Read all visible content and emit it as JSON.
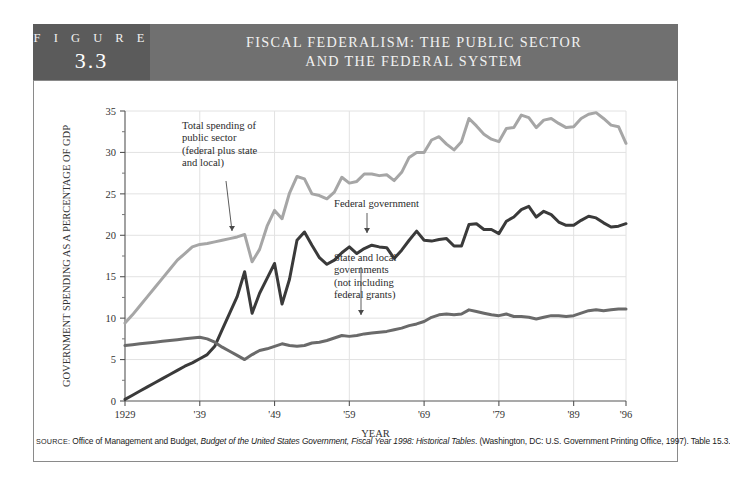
{
  "header": {
    "figure_word": "F I G U R E",
    "figure_number": "3.3",
    "title_line1": "FISCAL FEDERALISM: THE PUBLIC SECTOR",
    "title_line2": "AND THE FEDERAL SYSTEM",
    "box_color": "#5b5b5b",
    "title_bg_color": "#707070"
  },
  "source": {
    "label": "SOURCE:",
    "text_before_italic": " Office of Management and Budget, ",
    "italic_text": "Budget of the United States Government, Fiscal Year 1998: Historical Tables",
    "text_after_italic": ". (Washington, DC: U.S. Government Printing Office, 1997). Table 15.3."
  },
  "annotations": [
    {
      "id": "total-spending",
      "lines": [
        "Total spending of",
        "public sector",
        "(federal plus state",
        "and local)"
      ]
    },
    {
      "id": "federal-government",
      "lines": [
        "Federal government"
      ]
    },
    {
      "id": "state-local",
      "lines": [
        "State and local",
        "governments",
        "(not including",
        "federal grants)"
      ]
    }
  ],
  "chart_data": {
    "type": "line",
    "title": "FISCAL FEDERALISM: THE PUBLIC SECTOR AND THE FEDERAL SYSTEM",
    "xlabel": "YEAR",
    "ylabel": "GOVERNMENT SPENDING AS A PERCENTAGE OF GDP",
    "xlim": [
      1929,
      1996
    ],
    "ylim": [
      0,
      35
    ],
    "yticks": [
      0,
      5,
      10,
      15,
      20,
      25,
      30,
      35
    ],
    "xticks": [
      1929,
      1939,
      1949,
      1959,
      1969,
      1979,
      1989,
      1996
    ],
    "xticklabels": [
      "1929",
      "'39",
      "'49",
      "'59",
      "'69",
      "'79",
      "'89",
      "'96"
    ],
    "grid": true,
    "legend": "annotations",
    "x": [
      1929,
      1930,
      1931,
      1932,
      1933,
      1934,
      1935,
      1936,
      1937,
      1938,
      1939,
      1940,
      1941,
      1942,
      1943,
      1944,
      1945,
      1946,
      1947,
      1948,
      1949,
      1950,
      1951,
      1952,
      1953,
      1954,
      1955,
      1956,
      1957,
      1958,
      1959,
      1960,
      1961,
      1962,
      1963,
      1964,
      1965,
      1966,
      1967,
      1968,
      1969,
      1970,
      1971,
      1972,
      1973,
      1974,
      1975,
      1976,
      1977,
      1978,
      1979,
      1980,
      1981,
      1982,
      1983,
      1984,
      1985,
      1986,
      1987,
      1988,
      1989,
      1990,
      1991,
      1992,
      1993,
      1994,
      1995,
      1996
    ],
    "series": [
      {
        "name": "Total spending of public sector (federal plus state and local)",
        "color": "#a6a6a6",
        "values": [
          9.4,
          10.4,
          11.5,
          12.6,
          13.7,
          14.8,
          15.9,
          17.0,
          17.8,
          18.6,
          18.9,
          19.0,
          19.2,
          19.4,
          19.6,
          19.8,
          20.1,
          16.8,
          18.3,
          21.1,
          23.0,
          22.0,
          25.1,
          27.1,
          26.8,
          25.0,
          24.8,
          24.4,
          25.2,
          27.0,
          26.3,
          26.5,
          27.4,
          27.4,
          27.2,
          27.3,
          26.6,
          27.6,
          29.4,
          30.0,
          30.0,
          31.5,
          31.9,
          31.0,
          30.3,
          31.3,
          34.1,
          33.2,
          32.2,
          31.6,
          31.3,
          32.9,
          33.0,
          34.5,
          34.2,
          33.0,
          33.9,
          34.1,
          33.5,
          33.0,
          33.1,
          34.1,
          34.6,
          34.8,
          34.1,
          33.3,
          33.1,
          31.1
        ]
      },
      {
        "name": "Federal government",
        "color": "#3a3a3a",
        "values": [
          0.2,
          0.7,
          1.2,
          1.7,
          2.2,
          2.7,
          3.2,
          3.7,
          4.2,
          4.6,
          5.1,
          5.6,
          6.6,
          8.6,
          10.6,
          12.6,
          15.6,
          10.6,
          13.0,
          14.8,
          16.6,
          11.7,
          14.7,
          19.4,
          20.4,
          18.8,
          17.3,
          16.5,
          17.0,
          17.9,
          18.6,
          17.8,
          18.4,
          18.8,
          18.6,
          18.5,
          17.2,
          18.2,
          19.4,
          20.5,
          19.4,
          19.3,
          19.5,
          19.6,
          18.7,
          18.7,
          21.3,
          21.4,
          20.7,
          20.7,
          20.2,
          21.7,
          22.2,
          23.1,
          23.5,
          22.2,
          22.9,
          22.5,
          21.6,
          21.2,
          21.2,
          21.8,
          22.3,
          22.1,
          21.5,
          21.0,
          21.1,
          21.4
        ]
      },
      {
        "name": "State and local governments (not including federal grants)",
        "color": "#6a6a6a",
        "values": [
          6.7,
          6.8,
          6.9,
          7.0,
          7.1,
          7.2,
          7.3,
          7.4,
          7.5,
          7.6,
          7.7,
          7.5,
          7.1,
          6.5,
          6.0,
          5.5,
          5.0,
          5.6,
          6.1,
          6.3,
          6.6,
          6.9,
          6.7,
          6.6,
          6.7,
          7.0,
          7.1,
          7.3,
          7.6,
          7.9,
          7.8,
          7.9,
          8.1,
          8.2,
          8.3,
          8.4,
          8.6,
          8.8,
          9.1,
          9.3,
          9.6,
          10.1,
          10.4,
          10.5,
          10.4,
          10.5,
          11.0,
          10.8,
          10.6,
          10.4,
          10.3,
          10.5,
          10.2,
          10.2,
          10.1,
          9.9,
          10.1,
          10.3,
          10.3,
          10.2,
          10.3,
          10.6,
          10.9,
          11.0,
          10.9,
          11.0,
          11.1,
          11.1
        ]
      }
    ]
  }
}
